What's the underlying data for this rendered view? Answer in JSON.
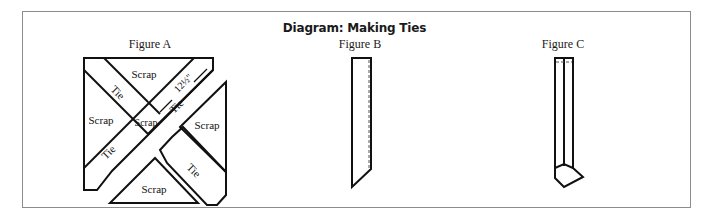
{
  "diagram": {
    "title": "Diagram: Making Ties",
    "figures": [
      {
        "label": "Figure A",
        "pieces": {
          "scrap_top": "Scrap",
          "scrap_left": "Scrap",
          "scrap_center": "Scrap",
          "scrap_right": "Scrap",
          "scrap_bottom": "Scrap",
          "tie_upper_left": "Tie",
          "tie_lower_left": "Tie",
          "tie_upper_right": "Tie",
          "tie_lower_right": "Tie"
        },
        "measurement": "12½\""
      },
      {
        "label": "Figure B"
      },
      {
        "label": "Figure C"
      }
    ]
  },
  "colors": {
    "stroke": "#111111",
    "frame": "#8c8c8c",
    "background": "#ffffff"
  }
}
